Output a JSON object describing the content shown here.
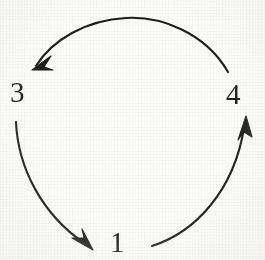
{
  "figure": {
    "background_color": "#fbfbf9",
    "stroke_color": "#1d1d1d",
    "stroke_width": 2.1
  },
  "nodes": [
    {
      "id": "node-1",
      "label": "1",
      "x": 110,
      "y": 228
    },
    {
      "id": "node-3",
      "label": "3",
      "x": 10,
      "y": 78
    },
    {
      "id": "node-4",
      "label": "4",
      "x": 226,
      "y": 80
    }
  ],
  "arrows": [
    {
      "id": "arrow-4-to-3",
      "name": "arrow-top-four-to-three",
      "from": "4",
      "to": "3",
      "direction": "right-to-left along top",
      "path": "M 228 72 C 205 32 160 16 126 18 C 86 20 52 40 36 66",
      "head_tip_x": 32,
      "head_tip_y": 70
    },
    {
      "id": "arrow-3-to-1",
      "name": "arrow-left-three-to-one",
      "from": "3",
      "to": "1",
      "direction": "top-to-bottom along left",
      "path": "M 16 122 C 18 168 42 214 84 243",
      "head_tip_x": 93,
      "head_tip_y": 250
    },
    {
      "id": "arrow-1-to-4",
      "name": "arrow-right-one-to-four",
      "from": "1",
      "to": "4",
      "direction": "bottom-to-top along right",
      "path": "M 152 246 C 196 232 234 190 244 128",
      "head_tip_x": 246,
      "head_tip_y": 116
    }
  ]
}
